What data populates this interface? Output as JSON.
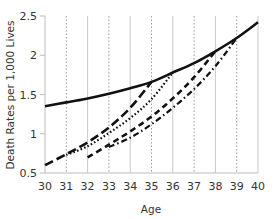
{
  "chart_data": {
    "type": "line",
    "title": "",
    "xlabel": "Age",
    "ylabel": "Death Rates per 1,000 Lives",
    "xlim": [
      30,
      40
    ],
    "ylim": [
      0.5,
      2.5
    ],
    "x_ticks": [
      30,
      31,
      32,
      33,
      34,
      35,
      36,
      37,
      38,
      39,
      40
    ],
    "y_ticks": [
      0.5,
      1,
      1.5,
      2,
      2.5
    ],
    "y_tick_labels": [
      "0.5",
      "1",
      "1.5",
      "2",
      "2.5"
    ],
    "grid": {
      "vertical": true,
      "horizontal": false,
      "solid_at": [
        32,
        34,
        36,
        38,
        40
      ],
      "dotted_at": [
        31,
        33,
        35,
        37,
        39
      ]
    },
    "legend": null,
    "series": [
      {
        "name": "Ultimate",
        "style": "solid",
        "x": [
          30,
          31,
          32,
          33,
          34,
          35,
          36,
          37,
          38,
          39,
          40
        ],
        "y": [
          1.35,
          1.4,
          1.45,
          1.51,
          1.58,
          1.66,
          1.78,
          1.9,
          2.05,
          2.22,
          2.42
        ]
      },
      {
        "name": "Select from age 30",
        "style": "long-dash",
        "x": [
          30,
          31,
          32,
          33,
          34,
          35
        ],
        "y": [
          0.6,
          0.74,
          0.89,
          1.08,
          1.33,
          1.66
        ]
      },
      {
        "name": "Select from age 31",
        "style": "dotted",
        "x": [
          31,
          32,
          33,
          34,
          35,
          36
        ],
        "y": [
          0.73,
          0.84,
          1.01,
          1.2,
          1.44,
          1.78
        ]
      },
      {
        "name": "Select from age 32",
        "style": "medium-dash",
        "x": [
          32,
          33,
          34,
          35,
          36,
          37,
          38
        ],
        "y": [
          0.7,
          0.86,
          1.03,
          1.22,
          1.45,
          1.72,
          2.05
        ]
      },
      {
        "name": "Select from age 33",
        "style": "dash-dot",
        "x": [
          33,
          34,
          35,
          36,
          37,
          38,
          39
        ],
        "y": [
          0.83,
          0.95,
          1.12,
          1.33,
          1.57,
          1.86,
          2.22
        ]
      }
    ]
  }
}
